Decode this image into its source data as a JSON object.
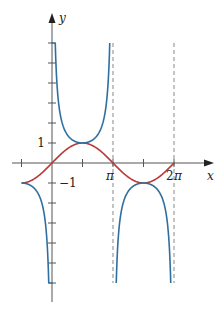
{
  "chart_data": {
    "type": "line",
    "title": "",
    "xlabel": "x",
    "ylabel": "y",
    "xlim": [
      -1.5708,
      6.5
    ],
    "ylim": [
      -6,
      6
    ],
    "grid": false,
    "legend": null,
    "x_tick_labels": [
      {
        "value": 3.14159,
        "label": "π"
      },
      {
        "value": 6.28319,
        "label": "2π"
      }
    ],
    "x_ticks": [
      -1.5708,
      1.5708,
      3.14159,
      4.71239,
      6.28319
    ],
    "y_tick_labels": [
      {
        "value": 1,
        "label": "1"
      },
      {
        "value": -1,
        "label": "−1"
      }
    ],
    "y_ticks": [
      -6,
      -5,
      -4,
      -3,
      -2,
      -1,
      1,
      2,
      3,
      4,
      5,
      6
    ],
    "series": [
      {
        "name": "y = sin x",
        "color": "#b83a3a",
        "domain": [
          -1.5708,
          6.28319
        ]
      },
      {
        "name": "y = csc x",
        "color": "#2f6fa0",
        "domain": [
          -1.5708,
          6.28319
        ],
        "clip": [
          -6,
          6
        ]
      }
    ],
    "asymptotes": [
      {
        "x": 3.14159,
        "style": "dashed"
      },
      {
        "x": 6.28319,
        "style": "dashed"
      }
    ]
  },
  "labels": {
    "x_axis": "x",
    "y_axis": "y",
    "tick_1": "1",
    "tick_neg1": "−1",
    "tick_pi": "π",
    "tick_2pi_num": "2",
    "tick_2pi_pi": "π"
  },
  "colors": {
    "sin": "#b83a3a",
    "csc": "#2f6fa0",
    "axis": "#555555",
    "asymptote": "#888888"
  }
}
